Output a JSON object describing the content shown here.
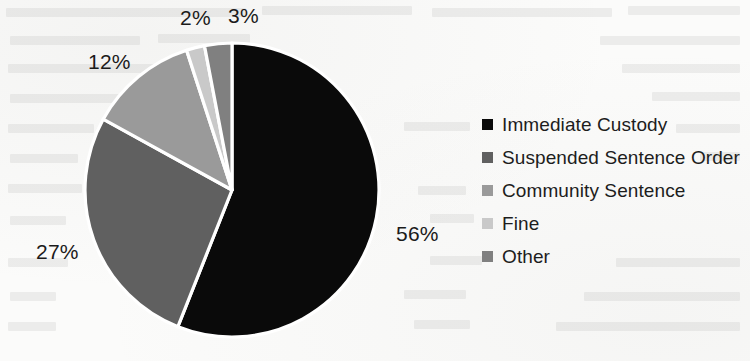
{
  "chart_data": {
    "type": "pie",
    "title": "",
    "categories": [
      "Immediate Custody",
      "Suspended Sentence Order",
      "Community Sentence",
      "Fine",
      "Other"
    ],
    "values": [
      56,
      27,
      12,
      2,
      3
    ],
    "value_labels": [
      "56%",
      "27%",
      "12%",
      "2%",
      "3%"
    ],
    "unit": "%",
    "legend_position": "right",
    "grid": false,
    "colors": [
      "#0a0a0a",
      "#606060",
      "#9a9a9a",
      "#c9c9c9",
      "#808080"
    ],
    "start_angle_deg": 0,
    "direction": "clockwise",
    "slice_border_color": "#ffffff"
  },
  "labels": {
    "immediate_custody": "56%",
    "suspended_sentence_order": "27%",
    "community_sentence": "12%",
    "fine": "2%",
    "other": "3%"
  },
  "legend": {
    "items": [
      {
        "label": "Immediate Custody",
        "color": "#0a0a0a",
        "value": 56
      },
      {
        "label": "Suspended Sentence Order",
        "color": "#606060",
        "value": 27
      },
      {
        "label": "Community Sentence",
        "color": "#9a9a9a",
        "value": 12
      },
      {
        "label": "Fine",
        "color": "#c9c9c9",
        "value": 2
      },
      {
        "label": "Other",
        "color": "#808080",
        "value": 3
      }
    ]
  }
}
